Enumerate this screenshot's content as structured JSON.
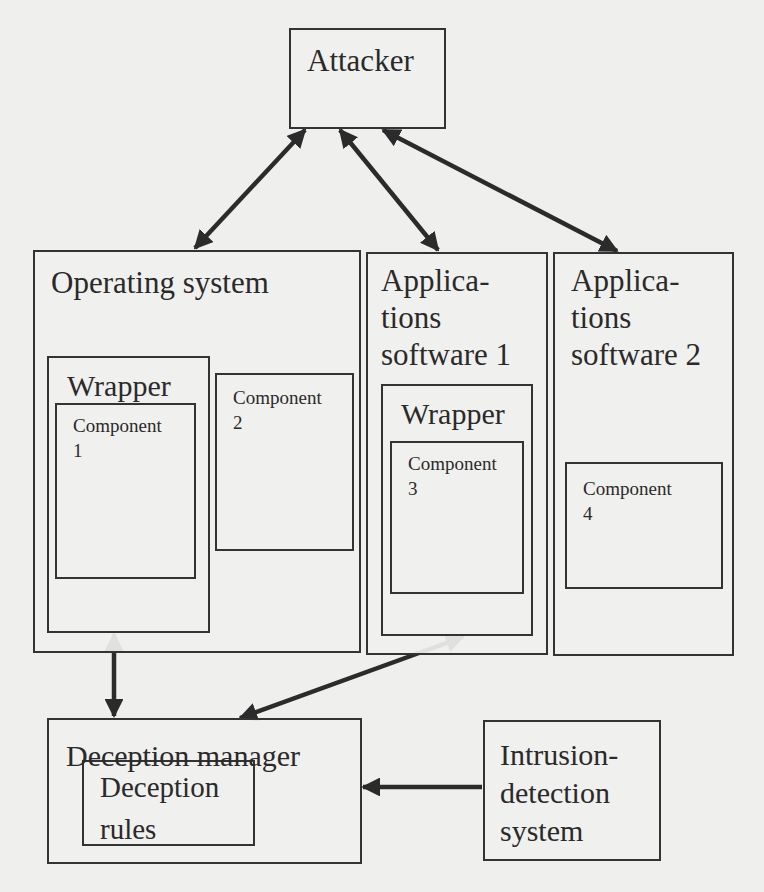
{
  "diagram": {
    "attacker": {
      "label": "Attacker"
    },
    "operating_system": {
      "label": "Operating system",
      "wrapper": {
        "label": "Wrapper",
        "component": {
          "label": "Component\n1"
        }
      },
      "component": {
        "label": "Component\n2"
      }
    },
    "applications_software_1": {
      "label": "Applica-\ntions\nsoftware 1",
      "wrapper": {
        "label": "Wrapper",
        "component": {
          "label": "Component\n3"
        }
      }
    },
    "applications_software_2": {
      "label": "Applica-\ntions\nsoftware 2",
      "component": {
        "label": "Component\n4"
      }
    },
    "deception_manager": {
      "label": "Deception manager",
      "rules": {
        "label": "Deception\nrules"
      }
    },
    "intrusion_detection_system": {
      "label": "Intrusion-\ndetection\nsystem"
    },
    "edges": [
      {
        "from": "Attacker",
        "to": "Operating system",
        "type": "bidirectional"
      },
      {
        "from": "Attacker",
        "to": "Applications software 1",
        "type": "bidirectional"
      },
      {
        "from": "Attacker",
        "to": "Applications software 2",
        "type": "bidirectional"
      },
      {
        "from": "Wrapper (Operating system)",
        "to": "Deception manager",
        "type": "bidirectional"
      },
      {
        "from": "Wrapper (Applications software 1)",
        "to": "Deception manager",
        "type": "bidirectional"
      },
      {
        "from": "Intrusion-detection system",
        "to": "Deception manager",
        "type": "directed"
      }
    ],
    "colors": {
      "line": "#333333",
      "background": "#efefed"
    }
  }
}
